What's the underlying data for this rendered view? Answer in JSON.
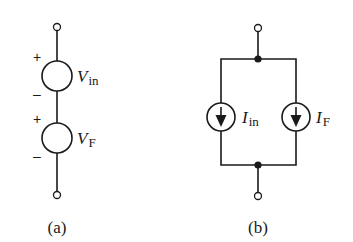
{
  "diagram": {
    "panels": [
      {
        "id": "a",
        "caption": "(a)",
        "type": "series-voltage-sources",
        "sources": [
          {
            "symbol": "V",
            "subscript": "in",
            "plus": "+",
            "minus": "–"
          },
          {
            "symbol": "V",
            "subscript": "F",
            "plus": "+",
            "minus": "–"
          }
        ]
      },
      {
        "id": "b",
        "caption": "(b)",
        "type": "parallel-current-sources",
        "sources": [
          {
            "symbol": "I",
            "subscript": "in",
            "direction": "down"
          },
          {
            "symbol": "I",
            "subscript": "F",
            "direction": "down"
          }
        ]
      }
    ],
    "colors": {
      "stroke": "#1a1a1a",
      "background": "#ffffff"
    }
  }
}
